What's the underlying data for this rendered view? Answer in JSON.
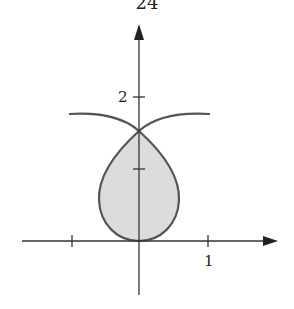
{
  "page_number": "24",
  "figure": {
    "type": "polar-curve-region",
    "labels": {
      "y_tick": "2",
      "x_tick": "1"
    },
    "colors": {
      "curve": "#555555",
      "fill": "#d9d9d9",
      "axes": "#333333"
    }
  }
}
